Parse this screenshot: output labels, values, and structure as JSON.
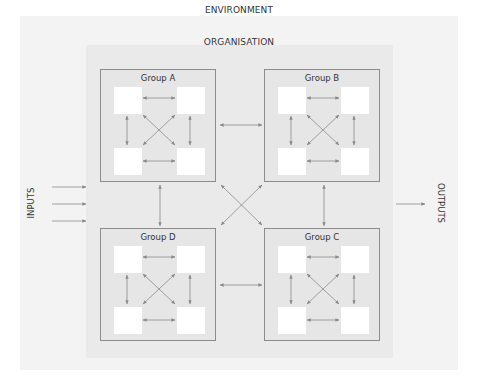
{
  "environment": {
    "label": "ENVIRONMENT"
  },
  "organisation": {
    "label": "ORGANISATION"
  },
  "groups": [
    {
      "id": "A",
      "title": "Group A"
    },
    {
      "id": "B",
      "title": "Group B"
    },
    {
      "id": "C",
      "title": "Group C"
    },
    {
      "id": "D",
      "title": "Group D"
    }
  ],
  "inputs": {
    "label": "INPUTS",
    "arrow_count": 3
  },
  "outputs": {
    "label": "OUTPUTS",
    "arrow_count": 1
  },
  "colors": {
    "environment_bg": "#f3f3f3",
    "organisation_bg": "#eaeaea",
    "group_bg": "#e6e6e6",
    "group_border": "#8c8c8c",
    "node_fill": "#ffffff",
    "arrow": "#8a8a8a"
  },
  "connections": {
    "within_group": "each group's 4 nodes are fully connected by bidirectional arrows (horizontal, vertical, diagonal)",
    "between_groups": [
      "A<->B",
      "A<->D",
      "B<->C",
      "D<->C",
      "A<->C",
      "B<->D"
    ]
  }
}
